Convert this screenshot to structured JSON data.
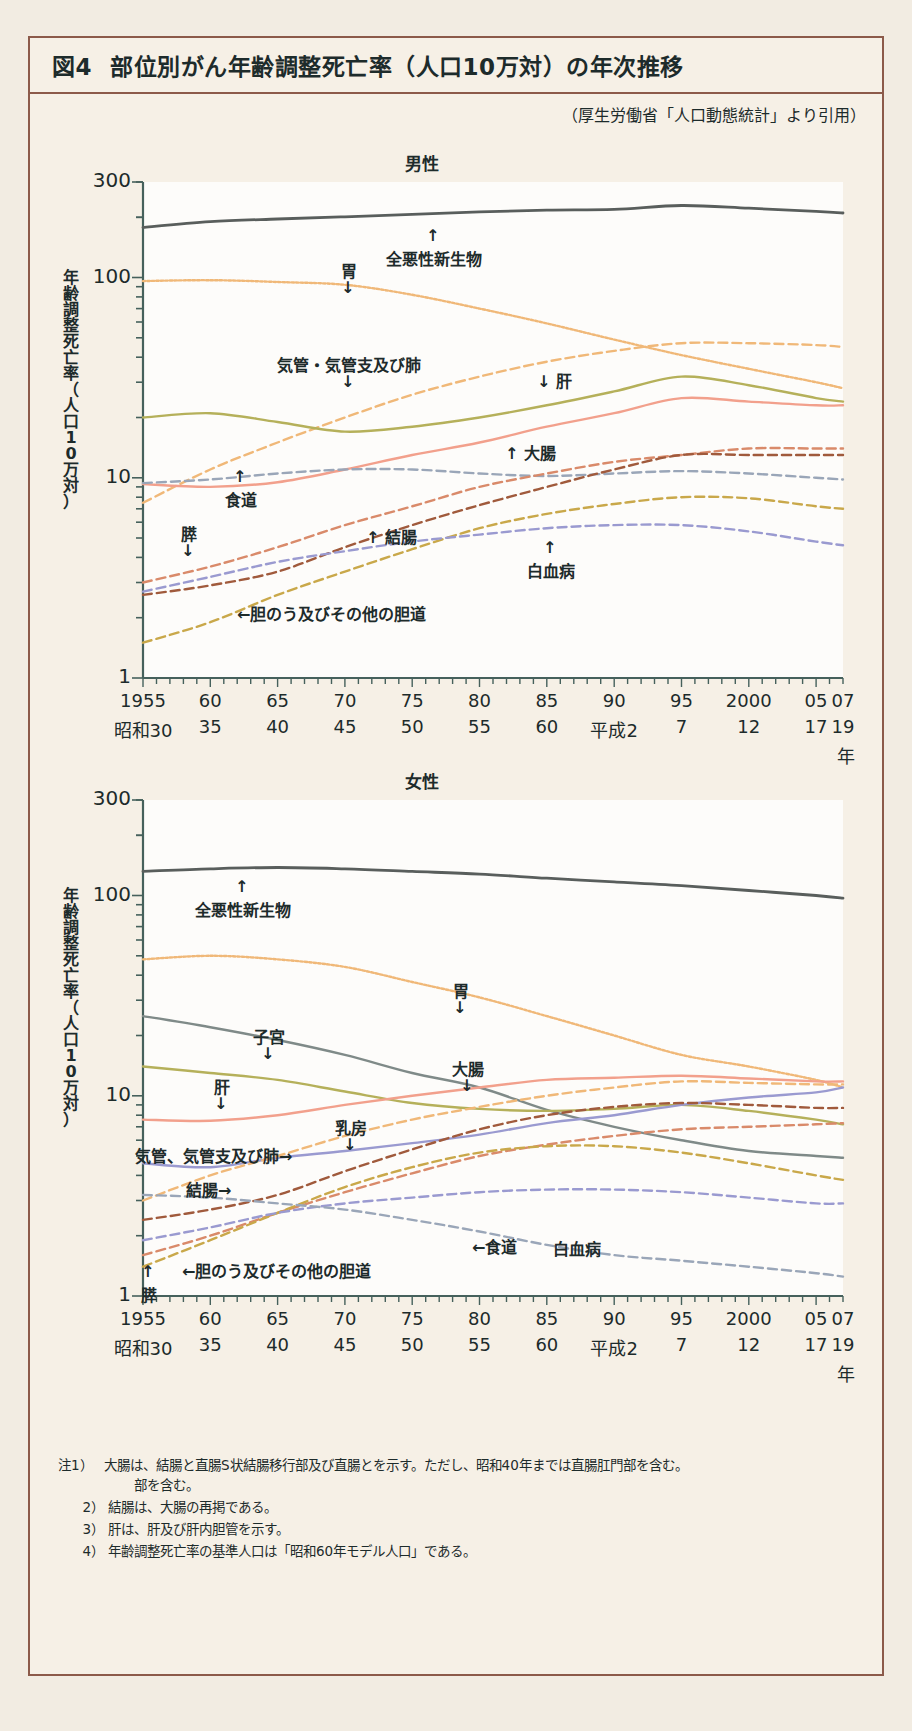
{
  "figure": {
    "number": "図4",
    "title": "部位別がん年齢調整死亡率（人口10万対）の年次推移",
    "source": "（厚生労働省「人口動態統計」より引用）"
  },
  "panels": {
    "male": {
      "title": "男性"
    },
    "female": {
      "title": "女性"
    }
  },
  "axis": {
    "ylabel": "年齢調整死亡率（人口10万対）",
    "ylabel_chars": [
      "年",
      "齢",
      "調",
      "整",
      "死",
      "亡",
      "率",
      "（",
      "人",
      "口",
      "1",
      "0",
      "万",
      "対",
      "）"
    ],
    "yticks": [
      "300",
      "100",
      "10",
      "1"
    ],
    "xlabel_unit": "年",
    "xticks_western": [
      "1955",
      "60",
      "65",
      "70",
      "75",
      "80",
      "85",
      "90",
      "95",
      "2000",
      "05",
      "07"
    ],
    "xticks_era": [
      "昭和30",
      "35",
      "40",
      "45",
      "50",
      "55",
      "60",
      "平成2",
      "7",
      "12",
      "17",
      "19"
    ]
  },
  "notes": [
    {
      "n": "注1）",
      "t": "大腸は、結腸と直腸S状結腸移行部及び直腸とを示す。ただし、昭和40年までは直腸肛門部を含む。"
    },
    {
      "n": "2）",
      "t": "結腸は、大腸の再掲である。"
    },
    {
      "n": "3）",
      "t": "肝は、肝及び肝内胆管を示す。"
    },
    {
      "n": "4）",
      "t": "年齢調整死亡率の基準人口は「昭和60年モデル人口」である。"
    }
  ],
  "notes_indent": "部を含む。",
  "annotations": {
    "male": [
      {
        "text": "全悪性新生物",
        "x": 386,
        "y": 246,
        "arrow": "up"
      },
      {
        "text": "胃",
        "x": 341,
        "y": 258,
        "arrow": "down"
      },
      {
        "text": "気管・気管支及び肺",
        "x": 277,
        "y": 352,
        "arrow": "down"
      },
      {
        "text": "↓ 肝",
        "x": 537,
        "y": 368,
        "arrow": "none"
      },
      {
        "text": "↑ 大腸",
        "x": 505,
        "y": 440,
        "arrow": "none"
      },
      {
        "text": "食道",
        "x": 225,
        "y": 487,
        "arrow": "up"
      },
      {
        "text": "膵",
        "x": 181,
        "y": 521,
        "arrow": "down"
      },
      {
        "text": "↑ 結腸",
        "x": 366,
        "y": 524,
        "arrow": "none"
      },
      {
        "text": "白血病",
        "x": 527,
        "y": 558,
        "arrow": "up"
      },
      {
        "text": "←胆のう及びその他の胆道",
        "x": 237,
        "y": 601,
        "arrow": "none"
      }
    ],
    "female": [
      {
        "text": "全悪性新生物",
        "x": 195,
        "y": 897,
        "arrow": "up"
      },
      {
        "text": "胃",
        "x": 453,
        "y": 978,
        "arrow": "down"
      },
      {
        "text": "子宮",
        "x": 253,
        "y": 1024,
        "arrow": "down"
      },
      {
        "text": "大腸",
        "x": 452,
        "y": 1056,
        "arrow": "down"
      },
      {
        "text": "肝",
        "x": 214,
        "y": 1074,
        "arrow": "down"
      },
      {
        "text": "乳房",
        "x": 335,
        "y": 1115,
        "arrow": "down"
      },
      {
        "text": "気管、気管支及び肺→",
        "x": 135,
        "y": 1143,
        "arrow": "none"
      },
      {
        "text": "結腸→",
        "x": 186,
        "y": 1177,
        "arrow": "none"
      },
      {
        "text": "←食道",
        "x": 472,
        "y": 1234,
        "arrow": "none"
      },
      {
        "text": "白血病",
        "x": 553,
        "y": 1236,
        "arrow": "none"
      },
      {
        "text": "←胆のう及びその他の胆道",
        "x": 182,
        "y": 1258,
        "arrow": "none"
      },
      {
        "text": "膵",
        "x": 141,
        "y": 1282,
        "arrow": "up"
      }
    ]
  },
  "chart_data": {
    "type": "line",
    "title": "部位別がん年齢調整死亡率（人口10万対）の年次推移",
    "xlabel": "年",
    "ylabel": "年齢調整死亡率（人口10万対）",
    "yscale": "log",
    "ylim": [
      1,
      300
    ],
    "xlim": [
      1955,
      2007
    ],
    "grid": false,
    "legend": "inline-annotations",
    "x": [
      1955,
      1960,
      1965,
      1970,
      1975,
      1980,
      1985,
      1990,
      1995,
      2000,
      2005,
      2007
    ],
    "charts": [
      {
        "panel": "男性",
        "series": [
          {
            "name": "全悪性新生物",
            "color": "#595e5c",
            "style": "solid",
            "values": [
              178,
              190,
              196,
              201,
              207,
              213,
              217,
              219,
              229,
              222,
              214,
              210
            ]
          },
          {
            "name": "胃",
            "color": "#f0b878",
            "style": "dotted",
            "values": [
              96,
              97,
              95,
              92,
              82,
              70,
              59,
              49,
              41,
              35,
              30,
              28
            ]
          },
          {
            "name": "気管・気管支及び肺",
            "color": "#f0b878",
            "style": "dashed",
            "values": [
              7.5,
              11,
              15,
              20,
              26,
              32,
              38,
              43,
              47,
              47,
              46,
              45
            ]
          },
          {
            "name": "肝",
            "color": "#b5b05a",
            "style": "solid",
            "values": [
              20,
              21,
              19,
              17,
              18,
              20,
              23,
              27,
              32,
              29,
              25,
              24
            ]
          },
          {
            "name": "大腸",
            "color": "#f2a08c",
            "style": "solid",
            "values": [
              9.3,
              9.0,
              9.5,
              11,
              13,
              15,
              18,
              21,
              25,
              24,
              23,
              23
            ]
          },
          {
            "name": "食道",
            "color": "#9aa6b8",
            "style": "dashed",
            "values": [
              9.4,
              9.8,
              10.5,
              11,
              11,
              10.5,
              10.2,
              10.5,
              10.8,
              10.5,
              10.0,
              9.8
            ]
          },
          {
            "name": "膵",
            "color": "#d98a6a",
            "style": "dashed",
            "values": [
              3.0,
              3.6,
              4.5,
              5.8,
              7.2,
              9.0,
              10.5,
              12,
              13,
              14,
              14,
              14
            ]
          },
          {
            "name": "結腸",
            "color": "#a05a3c",
            "style": "dashed",
            "values": [
              2.6,
              2.9,
              3.4,
              4.5,
              5.8,
              7.3,
              9.0,
              11,
              13,
              13,
              13,
              13
            ]
          },
          {
            "name": "胆のう及びその他の胆道",
            "color": "#c9a84a",
            "style": "dashed",
            "values": [
              1.5,
              1.9,
              2.6,
              3.4,
              4.4,
              5.6,
              6.6,
              7.4,
              8.0,
              7.9,
              7.2,
              7.0
            ]
          },
          {
            "name": "白血病",
            "color": "#9a9ad0",
            "style": "dashed",
            "values": [
              2.7,
              3.2,
              3.8,
              4.3,
              4.8,
              5.2,
              5.6,
              5.8,
              5.8,
              5.4,
              4.8,
              4.6
            ]
          }
        ]
      },
      {
        "panel": "女性",
        "series": [
          {
            "name": "全悪性新生物",
            "color": "#595e5c",
            "style": "solid",
            "values": [
              132,
              136,
              138,
              136,
              132,
              128,
              122,
              117,
              112,
              106,
              100,
              97
            ]
          },
          {
            "name": "胃",
            "color": "#f0b878",
            "style": "dotted",
            "values": [
              48,
              50,
              48,
              44,
              37,
              31,
              25,
              20,
              16,
              14,
              12,
              11
            ]
          },
          {
            "name": "子宮",
            "color": "#7f8a88",
            "style": "solid",
            "values": [
              25,
              22,
              19,
              16,
              13,
              11,
              8.5,
              7.0,
              6.0,
              5.3,
              5.0,
              4.9
            ]
          },
          {
            "name": "肝",
            "color": "#b5b05a",
            "style": "solid",
            "values": [
              14,
              13,
              12,
              10.5,
              9.2,
              8.6,
              8.4,
              8.6,
              9.0,
              8.4,
              7.6,
              7.2
            ]
          },
          {
            "name": "大腸",
            "color": "#f2a08c",
            "style": "solid",
            "values": [
              7.6,
              7.5,
              8.0,
              9.0,
              10.0,
              11.0,
              12.0,
              12.3,
              12.6,
              12.2,
              11.8,
              11.8
            ]
          },
          {
            "name": "乳房",
            "color": "#9a9ad0",
            "style": "solid",
            "values": [
              4.6,
              4.4,
              4.9,
              5.3,
              5.8,
              6.4,
              7.3,
              8.0,
              9.0,
              9.8,
              10.4,
              11.0
            ]
          },
          {
            "name": "気管、気管支及び肺",
            "color": "#f0b878",
            "style": "dashed",
            "values": [
              3.0,
              4.0,
              5.0,
              6.3,
              7.6,
              8.8,
              10.0,
              11.0,
              11.8,
              11.6,
              11.4,
              11.4
            ]
          },
          {
            "name": "結腸",
            "color": "#a05a3c",
            "style": "dashed",
            "values": [
              2.4,
              2.7,
              3.2,
              4.2,
              5.4,
              6.8,
              8.0,
              8.8,
              9.2,
              9.0,
              8.7,
              8.7
            ]
          },
          {
            "name": "膵",
            "color": "#d98a6a",
            "style": "dashed",
            "values": [
              1.6,
              2.0,
              2.6,
              3.3,
              4.1,
              5.0,
              5.7,
              6.3,
              6.8,
              7.0,
              7.2,
              7.3
            ]
          },
          {
            "name": "胆のう及びその他の胆道",
            "color": "#c9a84a",
            "style": "dashed",
            "values": [
              1.4,
              1.9,
              2.6,
              3.5,
              4.4,
              5.2,
              5.6,
              5.6,
              5.2,
              4.6,
              4.0,
              3.8
            ]
          },
          {
            "name": "白血病",
            "color": "#9a9ad0",
            "style": "dashed",
            "values": [
              1.9,
              2.2,
              2.6,
              2.9,
              3.1,
              3.3,
              3.4,
              3.4,
              3.3,
              3.1,
              2.9,
              2.9
            ]
          },
          {
            "name": "食道",
            "color": "#9aa6b8",
            "style": "dashed",
            "values": [
              3.2,
              3.1,
              2.9,
              2.7,
              2.4,
              2.1,
              1.8,
              1.6,
              1.5,
              1.4,
              1.3,
              1.25
            ]
          }
        ]
      }
    ]
  }
}
